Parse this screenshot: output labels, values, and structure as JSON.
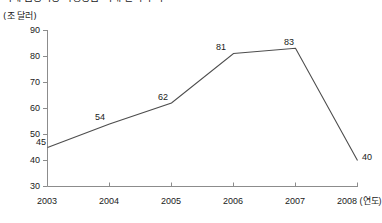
{
  "title": {
    "text": "국제 금융시장 파생상품 거래 잔액 추이",
    "cropped": true
  },
  "chart_data": {
    "type": "line",
    "title": "국제 금융시장 파생상품 거래 잔액 추이",
    "xlabel": "(연도)",
    "ylabel": "(조 달러)",
    "categories": [
      "2003",
      "2004",
      "2005",
      "2006",
      "2007",
      "2008"
    ],
    "values": [
      45,
      54,
      62,
      81,
      83,
      40
    ],
    "point_labels": [
      "45",
      "54",
      "62",
      "81",
      "83",
      "40"
    ],
    "xlim": [
      2003,
      2008
    ],
    "ylim": [
      30,
      90
    ],
    "yticks": [
      "30",
      "40",
      "50",
      "60",
      "70",
      "80",
      "90"
    ],
    "xticks": [
      "2003",
      "2004",
      "2005",
      "2006",
      "2007",
      "2008"
    ],
    "grid": false,
    "legend": null,
    "line_color": "#4d4d4d",
    "axis_color": "#8c8c8c",
    "background": "#ffffff"
  },
  "axes": {
    "y_unit_label": "(조 달러)",
    "x_unit_label": "(연도)",
    "x_last_tick_full": "2008 (연도)"
  }
}
